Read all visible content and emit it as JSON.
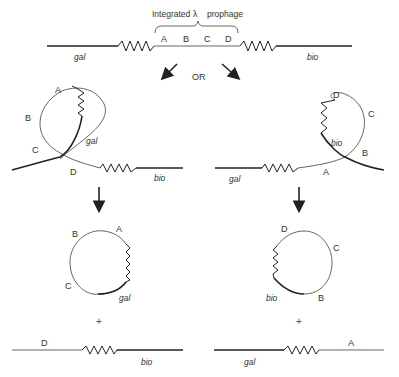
{
  "title": "Integrated",
  "lambda": "λ",
  "title_suffix": "prophage",
  "connector": "OR",
  "plus": "+",
  "genes": {
    "gal": "gal",
    "bio": "bio"
  },
  "top": {
    "sites": [
      "A",
      "B",
      "C",
      "D"
    ]
  },
  "left_loop": {
    "labels": {
      "A": "A",
      "B": "B",
      "C": "C",
      "D": "D"
    }
  },
  "right_loop": {
    "labels": {
      "A": "A",
      "B": "B",
      "C": "C",
      "D": "D"
    }
  },
  "left_circle": {
    "labels": {
      "A": "A",
      "B": "B",
      "C": "C"
    }
  },
  "right_circle": {
    "labels": {
      "B": "B",
      "C": "C",
      "D": "D"
    }
  },
  "left_linear": {
    "label": "D"
  },
  "right_linear": {
    "label": "A"
  },
  "colors": {
    "host_dna": "#222222",
    "phage_dna": "#666666"
  }
}
